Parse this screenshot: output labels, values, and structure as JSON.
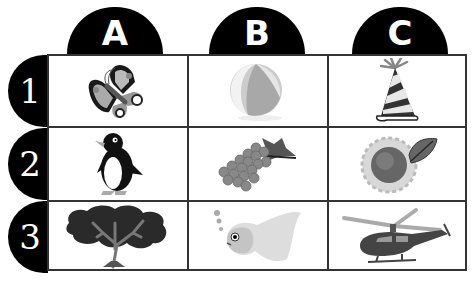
{
  "columns": [
    {
      "label": "A"
    },
    {
      "label": "B"
    },
    {
      "label": "C"
    }
  ],
  "rows": [
    {
      "label": "1"
    },
    {
      "label": "2"
    },
    {
      "label": "3"
    }
  ],
  "cells": [
    {
      "row": "1",
      "col": "A",
      "icon": "butterfly-icon"
    },
    {
      "row": "1",
      "col": "B",
      "icon": "beach-ball-icon"
    },
    {
      "row": "1",
      "col": "C",
      "icon": "party-hat-icon"
    },
    {
      "row": "2",
      "col": "A",
      "icon": "penguin-icon"
    },
    {
      "row": "2",
      "col": "B",
      "icon": "grapes-icon"
    },
    {
      "row": "2",
      "col": "C",
      "icon": "sunflower-icon"
    },
    {
      "row": "3",
      "col": "A",
      "icon": "tree-icon"
    },
    {
      "row": "3",
      "col": "B",
      "icon": "fish-icon"
    },
    {
      "row": "3",
      "col": "C",
      "icon": "helicopter-icon"
    }
  ],
  "colors": {
    "tab_background": "#000000",
    "tab_text": "#ffffff",
    "grid_line": "#333333"
  }
}
